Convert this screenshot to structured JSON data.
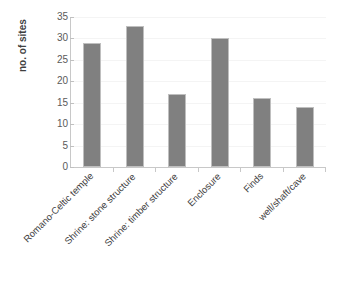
{
  "chart_data": {
    "type": "bar",
    "title": "",
    "subtitle": "",
    "xlabel": "",
    "ylabel": "no. of sites",
    "categories": [
      "Romano-Celtic temple",
      "Shrine: stone structure",
      "Shrine: timber structure",
      "Enclosure",
      "Finds",
      "well/shaft/cave"
    ],
    "values": [
      29,
      33,
      17,
      30,
      16,
      14
    ],
    "ylim": [
      0,
      35
    ],
    "ytick_labels": [
      "0",
      "5",
      "10",
      "15",
      "20",
      "25",
      "30",
      "35"
    ],
    "ytick_values": [
      0,
      5,
      10,
      15,
      20,
      25,
      30,
      35
    ],
    "ytick_step": 5,
    "grid": true,
    "grid_axis": "y",
    "legend": false,
    "legend_position": "none",
    "bar_color": "#808080",
    "bar_border_color": "#bfbfbf",
    "axis_color": "#c8c8c8",
    "grid_color": "#f4f4f4",
    "text_color": "#3f3f3f",
    "background": "#ffffff",
    "x_label_rotation": -45
  },
  "axis": {
    "y_title": "no. of sites"
  }
}
